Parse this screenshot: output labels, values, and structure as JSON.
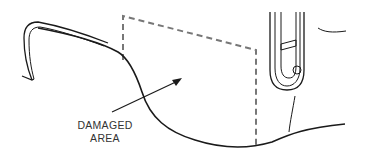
{
  "diagram": {
    "callout": {
      "line1": "DAMAGED",
      "line2": "AREA"
    },
    "colors": {
      "line": "#1a1a1a",
      "dashed_outline": "#777777",
      "label_text": "#333333",
      "background": "#ffffff"
    },
    "elements": [
      "body-panel-contour",
      "molding-strip-end",
      "dashed-damaged-region",
      "callout-arrow",
      "tail-lamp-assembly"
    ]
  }
}
